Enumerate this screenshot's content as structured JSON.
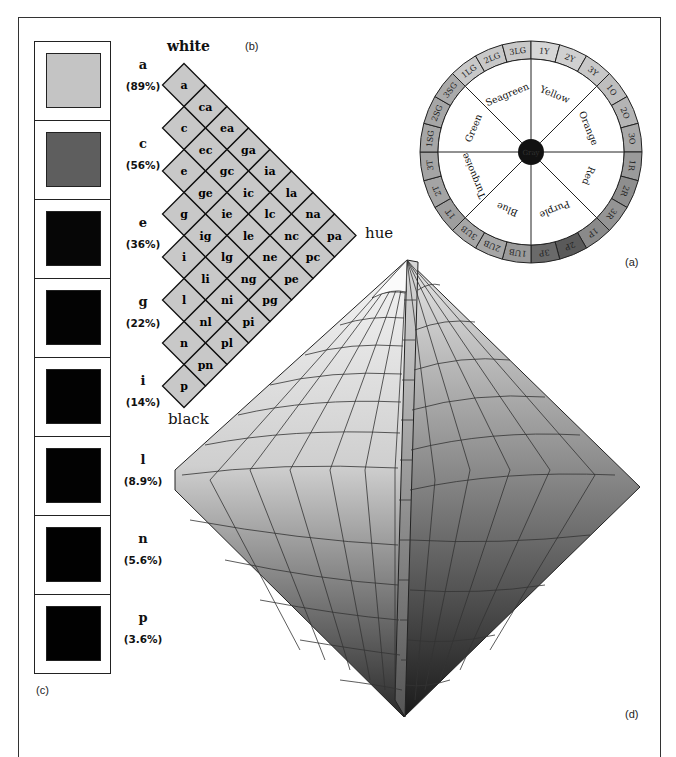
{
  "panels": {
    "a": {
      "caption": "(a)"
    },
    "b": {
      "caption": "(b)",
      "top_label": "white",
      "right_label": "hue",
      "bottom_label": "black"
    },
    "c": {
      "caption": "(c)"
    },
    "d": {
      "caption": "(d)"
    }
  },
  "swatches": [
    {
      "letter": "a",
      "percent": "(89%)",
      "color": "#c4c4c4"
    },
    {
      "letter": "c",
      "percent": "(56%)",
      "color": "#5e5e5e"
    },
    {
      "letter": "e",
      "percent": "(36%)",
      "color": "#060606"
    },
    {
      "letter": "g",
      "percent": "(22%)",
      "color": "#030303"
    },
    {
      "letter": "i",
      "percent": "(14%)",
      "color": "#020202"
    },
    {
      "letter": "l",
      "percent": "(8.9%)",
      "color": "#020202"
    },
    {
      "letter": "n",
      "percent": "(5.6%)",
      "color": "#010101"
    },
    {
      "letter": "p",
      "percent": "(3.6%)",
      "color": "#010101"
    }
  ],
  "grid_cells": [
    [
      "a"
    ],
    [
      "ca"
    ],
    [
      "c",
      "ea"
    ],
    [
      "ec",
      "ga"
    ],
    [
      "e",
      "gc",
      "ia"
    ],
    [
      "ge",
      "ic",
      "la"
    ],
    [
      "g",
      "ie",
      "lc",
      "na"
    ],
    [
      "ig",
      "le",
      "nc",
      "pa"
    ],
    [
      "i",
      "lg",
      "ne",
      "pc"
    ],
    [
      "li",
      "ng",
      "pe"
    ],
    [
      "l",
      "ni",
      "pg"
    ],
    [
      "nl",
      "pi"
    ],
    [
      "n",
      "pl"
    ],
    [
      "pn"
    ],
    [
      "p"
    ]
  ],
  "wheel": {
    "center_label": "Gray",
    "sectors": [
      "Seagreen",
      "Yellow",
      "Orange",
      "Red",
      "Purple",
      "Blue",
      "Turquoise",
      "Green"
    ],
    "ring": [
      {
        "label": "1LG",
        "color": "#c8c8c8"
      },
      {
        "label": "2LG",
        "color": "#c8c8c8"
      },
      {
        "label": "3LG",
        "color": "#c8c8c8"
      },
      {
        "label": "1Y",
        "color": "#d6d6d6"
      },
      {
        "label": "2Y",
        "color": "#d0d0d0"
      },
      {
        "label": "3Y",
        "color": "#c8c8c8"
      },
      {
        "label": "1O",
        "color": "#bebebe"
      },
      {
        "label": "2O",
        "color": "#b4b4b4"
      },
      {
        "label": "3O",
        "color": "#a8a8a8"
      },
      {
        "label": "1R",
        "color": "#9a9a9a"
      },
      {
        "label": "2R",
        "color": "#8e8e8e"
      },
      {
        "label": "3R",
        "color": "#949494"
      },
      {
        "label": "1P",
        "color": "#8a8a8a"
      },
      {
        "label": "2P",
        "color": "#5a5a5a"
      },
      {
        "label": "3P",
        "color": "#6a6a6a"
      },
      {
        "label": "1UB",
        "color": "#9a9a9a"
      },
      {
        "label": "2UB",
        "color": "#a6a6a6"
      },
      {
        "label": "3UB",
        "color": "#a6a6a6"
      },
      {
        "label": "1T",
        "color": "#9e9e9e"
      },
      {
        "label": "2T",
        "color": "#a4a4a4"
      },
      {
        "label": "3T",
        "color": "#a4a4a4"
      },
      {
        "label": "1SG",
        "color": "#a6a6a6"
      },
      {
        "label": "2SG",
        "color": "#a6a6a6"
      },
      {
        "label": "3SG",
        "color": "#aaaaaa"
      }
    ]
  }
}
